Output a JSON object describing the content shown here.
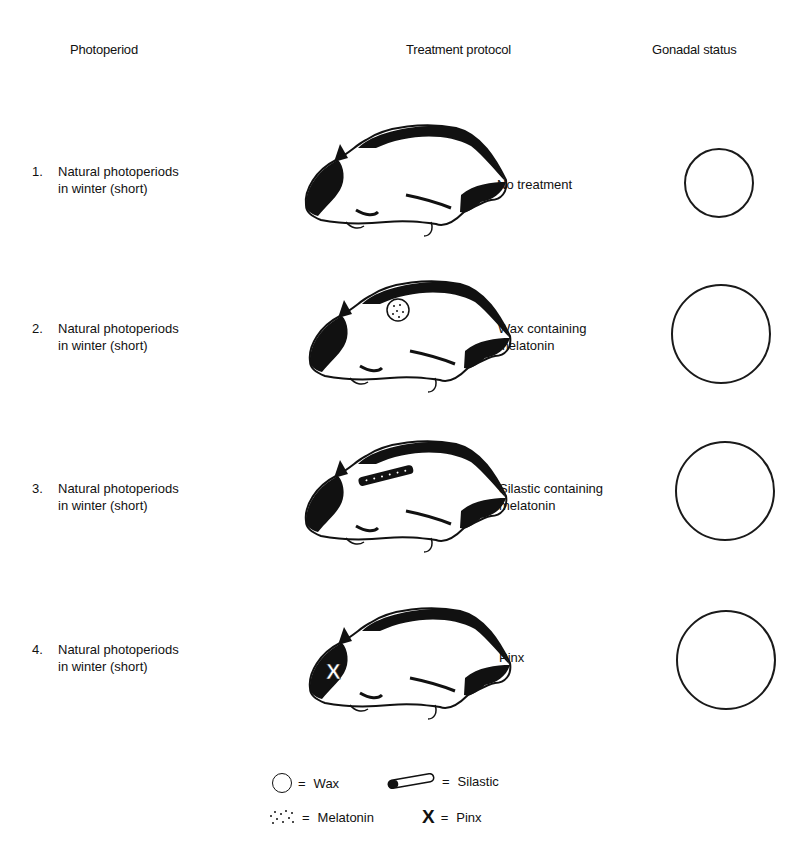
{
  "headers": {
    "photoperiod": "Photoperiod",
    "treatment": "Treatment protocol",
    "gonadal": "Gonadal status"
  },
  "rows": [
    {
      "number": "1.",
      "line1": "Natural photoperiods",
      "line2": "in winter (short)",
      "treatment_line1": "No treatment",
      "treatment_line2": "",
      "implant": "none",
      "gonad_size": "small"
    },
    {
      "number": "2.",
      "line1": "Natural photoperiods",
      "line2": "in winter (short)",
      "treatment_line1": "Wax containing",
      "treatment_line2": "melatonin",
      "implant": "wax-melatonin",
      "gonad_size": "large"
    },
    {
      "number": "3.",
      "line1": "Natural photoperiods",
      "line2": "in winter (short)",
      "treatment_line1": "Silastic containing",
      "treatment_line2": "melatonin",
      "implant": "silastic-melatonin",
      "gonad_size": "large"
    },
    {
      "number": "4.",
      "line1": "Natural photoperiods",
      "line2": "in winter (short)",
      "treatment_line1": "Pinx",
      "treatment_line2": "",
      "implant": "pinx",
      "gonad_size": "large"
    }
  ],
  "legend": {
    "equals": "=",
    "wax": "Wax",
    "silastic": "Silastic",
    "melatonin": "Melatonin",
    "pinx": "Pinx",
    "pinx_glyph": "X"
  }
}
